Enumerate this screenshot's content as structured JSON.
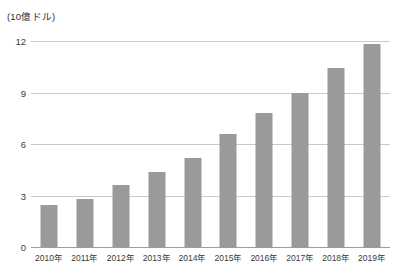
{
  "chart_data": {
    "type": "bar",
    "title": "",
    "subtitle": "",
    "unit_caption": "(10億ドル)",
    "xlabel": "",
    "ylabel": "",
    "categories": [
      "2010年",
      "2011年",
      "2012年",
      "2013年",
      "2014年",
      "2015年",
      "2016年",
      "2017年",
      "2018年",
      "2019年"
    ],
    "values": [
      2.45,
      2.8,
      3.6,
      4.35,
      5.2,
      6.6,
      7.8,
      9.0,
      10.4,
      11.8
    ],
    "ylim": [
      0,
      12
    ],
    "yticks": [
      0,
      3,
      6,
      9,
      12
    ],
    "ytick_labels": [
      "0",
      "3",
      "6",
      "9",
      "12"
    ],
    "grid": true,
    "grid_axis": "y",
    "legend": false,
    "legend_position": "none",
    "bar_color": "#9a9a9a",
    "gridline_color": "#c9c9c9",
    "axis_color": "#9d9d9d",
    "background_color": "#ffffff",
    "text_color": "#3a3a3a"
  }
}
